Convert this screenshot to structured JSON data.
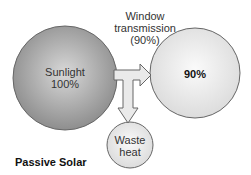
{
  "diagram": {
    "title": "Passive Solar",
    "source": {
      "label": "Sunlight",
      "value": "100%"
    },
    "flow_label": {
      "line1": "Window",
      "line2": "transmission",
      "line3": "(90%)"
    },
    "output": {
      "value": "90%"
    },
    "loss": {
      "line1": "Waste",
      "line2": "heat"
    },
    "colors": {
      "source_fill": "#9a9a9a",
      "output_fill": "#e6e6e6",
      "loss_fill": "#eeeeee",
      "arrow_fill": "#eaeaea",
      "stroke": "#666666"
    }
  }
}
